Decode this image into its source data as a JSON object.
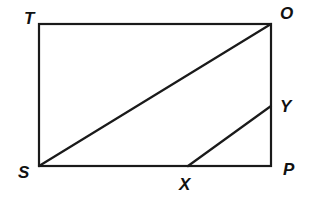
{
  "diagram": {
    "type": "geometry",
    "shape": "rectangle",
    "points": {
      "T": {
        "label": "T",
        "x": 39,
        "y": 24
      },
      "O": {
        "label": "O",
        "x": 271,
        "y": 24
      },
      "P": {
        "label": "P",
        "x": 271,
        "y": 166
      },
      "S": {
        "label": "S",
        "x": 39,
        "y": 166
      },
      "X": {
        "label": "X",
        "x": 188,
        "y": 166
      },
      "Y": {
        "label": "Y",
        "x": 271,
        "y": 106
      }
    },
    "segments": [
      "TO",
      "OP",
      "PS",
      "ST",
      "SO",
      "XY"
    ],
    "labels": {
      "T": "T",
      "O": "O",
      "Y": "Y",
      "P": "P",
      "S": "S",
      "X": "X"
    },
    "line_color": "#1a1a1a"
  }
}
